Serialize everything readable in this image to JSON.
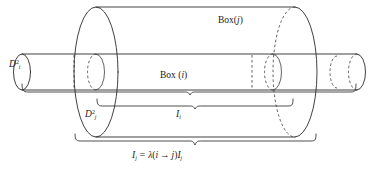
{
  "figure": {
    "caption_labels": {
      "box_outer": {
        "text": "Box(j)",
        "name": "box-j",
        "prefix": "Box(",
        "index": "j",
        "suffix": ")"
      },
      "box_inner": {
        "text": "Box (i)",
        "name": "box-i",
        "prefix": "Box (",
        "index": "i",
        "suffix": ")"
      },
      "disk_inner": {
        "text": "D_i^2",
        "base": "D",
        "sub": "i",
        "sup": "2"
      },
      "disk_outer": {
        "text": "D_j^2",
        "base": "D",
        "sub": "j",
        "sup": "2"
      },
      "interval_inner": {
        "text": "I_i",
        "base": "I",
        "sub": "i"
      },
      "formula": {
        "lhs_base": "I",
        "lhs_sub": "j",
        "equals": "=",
        "lambda": "λ",
        "open_paren": "(",
        "arg_from": "i",
        "arrow": "→",
        "arg_to": "j",
        "close_paren": ")",
        "rhs_base": "I",
        "rhs_sub": "j",
        "full": "I_j = λ(i → j)I_j"
      }
    },
    "colors": {
      "background": "#ffffff",
      "stroke": "#2b2b2b",
      "stroke_light": "#3a3a3a",
      "brace": "#2f2f2f",
      "text": "#1a1a1a"
    },
    "geometry": {
      "canvas_width": 379,
      "canvas_height": 176,
      "inner_tube": {
        "name": "thin-cylinder-box-i",
        "left_x": 22,
        "right_x": 357,
        "axis_y": 72,
        "radius_y": 18,
        "radius_x": 8
      },
      "outer_tube": {
        "name": "large-cylinder-box-j",
        "left_x": 96,
        "right_x": 295,
        "axis_y": 72,
        "radius_y": 65,
        "radius_x": 22
      },
      "braces": [
        {
          "name": "brace-interval-i",
          "x_start": 96,
          "x_end": 295,
          "y": 106,
          "label": "I_i"
        },
        {
          "name": "brace-interval-j",
          "x_start": 74,
          "x_end": 295,
          "y": 141,
          "label": "I_j = lambda(i -> j)I_j"
        },
        {
          "name": "brace-disk-i",
          "x_start": 22,
          "x_end": 357,
          "y": 91,
          "label": ""
        }
      ]
    }
  }
}
